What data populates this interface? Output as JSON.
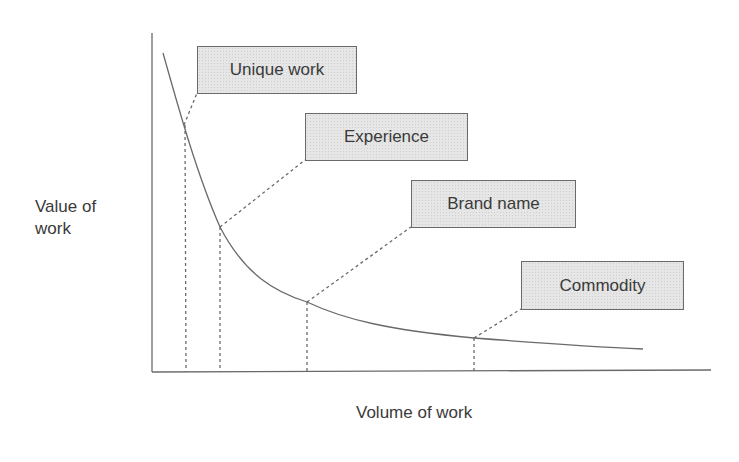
{
  "diagram": {
    "title": "",
    "y_axis_label": "Value of\nwork",
    "y_axis_label_lines": [
      "Value of",
      "work"
    ],
    "x_axis_label": "Volume of work",
    "curve": {
      "description": "decreasing hyperbolic curve: value of work falls as volume rises",
      "color": "#6a6a6a"
    },
    "categories": [
      {
        "label": "Unique work",
        "order": 1,
        "relative_volume": "lowest",
        "relative_value": "highest"
      },
      {
        "label": "Experience",
        "order": 2,
        "relative_volume": "low",
        "relative_value": "high"
      },
      {
        "label": "Brand name",
        "order": 3,
        "relative_volume": "medium",
        "relative_value": "medium"
      },
      {
        "label": "Commodity",
        "order": 4,
        "relative_volume": "highest",
        "relative_value": "lowest"
      }
    ],
    "colors": {
      "axis": "#6a6a6a",
      "box_fill": "#e6e6e6",
      "box_border": "#6a6a6a",
      "text": "#3a3a3a"
    }
  }
}
